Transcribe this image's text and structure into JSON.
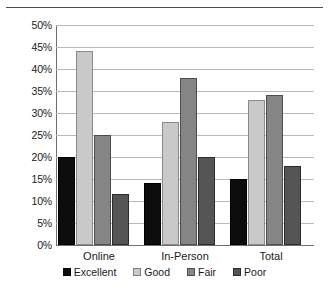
{
  "chart_data": {
    "type": "bar",
    "title": "",
    "subtitle": "",
    "xlabel": "",
    "ylabel": "",
    "categories": [
      "Online",
      "In-Person",
      "Total"
    ],
    "series": [
      {
        "name": "Excellent",
        "color": "#0d0d0d",
        "values": [
          20,
          14,
          15
        ]
      },
      {
        "name": "Good",
        "color": "#c9c9c9",
        "values": [
          44,
          28,
          33
        ]
      },
      {
        "name": "Fair",
        "color": "#858585",
        "values": [
          25,
          38,
          34
        ]
      },
      {
        "name": "Poor",
        "color": "#555555",
        "values": [
          11.5,
          20,
          18
        ]
      }
    ],
    "ylim": [
      0,
      50
    ],
    "ytick_step": 5,
    "ytick_labels": [
      "50%",
      "45%",
      "40%",
      "35%",
      "30%",
      "25%",
      "20%",
      "15%",
      "10%",
      "5%",
      "0%"
    ],
    "grid": true,
    "grid_axis": "y",
    "legend_position": "bottom",
    "value_suffix": "%"
  },
  "legend": {
    "items": [
      {
        "label": "Excellent"
      },
      {
        "label": "Good"
      },
      {
        "label": "Fair"
      },
      {
        "label": "Poor"
      }
    ]
  }
}
